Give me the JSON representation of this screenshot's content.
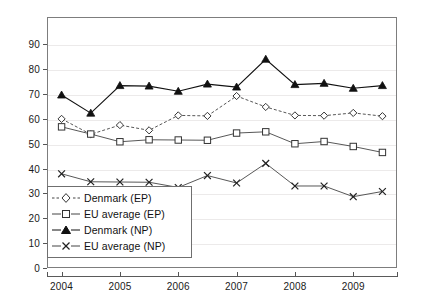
{
  "chart_data": {
    "type": "line",
    "title": "",
    "subtitle": "",
    "xlabel": "",
    "ylabel": "",
    "grid": true,
    "legend_position": "bottom-left",
    "xlim": [
      2003.75,
      2009.75
    ],
    "ylim": [
      0,
      101
    ],
    "ytick_labels": [
      "0",
      "10",
      "20",
      "30",
      "40",
      "50",
      "60",
      "70",
      "80",
      "90"
    ],
    "yticks": [
      0,
      10,
      20,
      30,
      40,
      50,
      60,
      70,
      80,
      90
    ],
    "xtick_labels": [
      "2004",
      "2005",
      "2006",
      "2007",
      "2008",
      "2009"
    ],
    "xticks": [
      2004,
      2005,
      2006,
      2007,
      2008,
      2009
    ],
    "x": [
      2004,
      2004.5,
      2005,
      2005.5,
      2006,
      2006.5,
      2007,
      2007.5,
      2008,
      2008.5,
      2009,
      2009.5
    ],
    "series": [
      {
        "name": "Denmark (EP)",
        "marker": "diamond-open",
        "linestyle": "dashed",
        "color": "#444444",
        "values": [
          60.0,
          53.8,
          57.5,
          55.4,
          61.4,
          61.2,
          69.2,
          64.8,
          61.4,
          61.3,
          62.4,
          61.1
        ]
      },
      {
        "name": "EU average (EP)",
        "marker": "square-open",
        "linestyle": "solid",
        "color": "#444444",
        "values": [
          56.8,
          53.9,
          50.8,
          51.6,
          51.5,
          51.4,
          54.3,
          54.8,
          50.0,
          50.9,
          48.9,
          46.5
        ]
      },
      {
        "name": "Denmark (NP)",
        "marker": "triangle-filled",
        "linestyle": "solid",
        "color": "#111111",
        "values": [
          69.6,
          62.3,
          73.4,
          73.2,
          71.1,
          74.0,
          72.8,
          84.0,
          73.8,
          74.3,
          72.3,
          73.4
        ]
      },
      {
        "name": "EU average (NP)",
        "marker": "x-cross",
        "linestyle": "solid",
        "color": "#444444",
        "values": [
          37.9,
          34.7,
          34.6,
          34.5,
          32.4,
          37.2,
          34.2,
          42.1,
          33.0,
          33.0,
          28.7,
          30.8
        ]
      }
    ]
  },
  "legend": {
    "items": [
      {
        "label": "Denmark (EP)"
      },
      {
        "label": "EU average (EP)"
      },
      {
        "label": "Denmark (NP)"
      },
      {
        "label": "EU average (NP)"
      }
    ]
  }
}
